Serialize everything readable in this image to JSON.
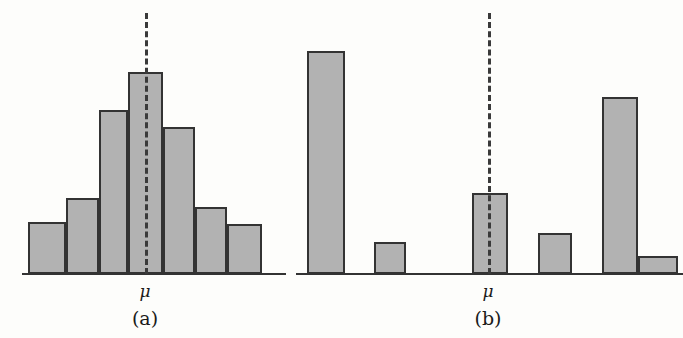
{
  "figure": {
    "background_color": "#fdfdfb",
    "bar_fill_color": "#b2b2b2",
    "bar_border_color": "#333333",
    "axis_color": "#333333",
    "mu_line_color": "#3a3a3a"
  },
  "chart_data": [
    {
      "type": "bar",
      "title": "(a)",
      "panel_label": "(a)",
      "xlabel": "",
      "ylabel": "",
      "annotations": [
        "μ"
      ],
      "mu_label": "μ",
      "mu_index": 3,
      "grid": false,
      "legend": "none",
      "axis_range_x": [
        0,
        7
      ],
      "ylim": [
        0,
        100
      ],
      "categories": [
        "1",
        "2",
        "3",
        "4",
        "5",
        "6",
        "7"
      ],
      "values": [
        25,
        37,
        81,
        100,
        72,
        33,
        25
      ],
      "description": "Symmetric bell-shaped histogram with mean line at the center (tallest bar)"
    },
    {
      "type": "bar",
      "title": "(b)",
      "panel_label": "(b)",
      "xlabel": "",
      "ylabel": "",
      "annotations": [
        "μ"
      ],
      "mu_label": "μ",
      "mu_index": 2,
      "grid": false,
      "legend": "none",
      "axis_range_x": [
        0,
        6
      ],
      "ylim": [
        0,
        100
      ],
      "categories": [
        "1",
        "2",
        "3",
        "4",
        "5",
        "6"
      ],
      "values": [
        100,
        14,
        36,
        19,
        79,
        8
      ],
      "description": "Irregular scattered histogram with mean line passing through a mid-height bar"
    }
  ],
  "panels": [
    {
      "id": "panel-a",
      "label": "(a)",
      "mu_label": "μ",
      "mu_label_x": 145,
      "mu_label_y": 283,
      "panel_label_x": 145,
      "panel_label_y": 309,
      "axis": {
        "x": 22,
        "y": 273,
        "width": 264
      },
      "mu_line": {
        "x": 145,
        "y_top": 13,
        "y_bottom": 274
      },
      "bars": [
        {
          "x": 28,
          "y": 222,
          "w": 38,
          "h": 52
        },
        {
          "x": 66,
          "y": 198,
          "w": 33,
          "h": 76
        },
        {
          "x": 99,
          "y": 110,
          "w": 29,
          "h": 164
        },
        {
          "x": 128,
          "y": 72,
          "w": 35,
          "h": 202
        },
        {
          "x": 163,
          "y": 127,
          "w": 32,
          "h": 147
        },
        {
          "x": 195,
          "y": 207,
          "w": 32,
          "h": 67
        },
        {
          "x": 227,
          "y": 224,
          "w": 35,
          "h": 50
        }
      ]
    },
    {
      "id": "panel-b",
      "label": "(b)",
      "mu_label": "μ",
      "mu_label_x": 488,
      "mu_label_y": 283,
      "panel_label_x": 488,
      "panel_label_y": 309,
      "axis": {
        "x": 296,
        "y": 273,
        "width": 387
      },
      "mu_line": {
        "x": 488,
        "y_top": 13,
        "y_bottom": 274
      },
      "bars": [
        {
          "x": 307,
          "y": 51,
          "w": 38,
          "h": 223
        },
        {
          "x": 374,
          "y": 242,
          "w": 32,
          "h": 32
        },
        {
          "x": 472,
          "y": 193,
          "w": 36,
          "h": 81
        },
        {
          "x": 538,
          "y": 233,
          "w": 34,
          "h": 41
        },
        {
          "x": 602,
          "y": 97,
          "w": 36,
          "h": 177
        },
        {
          "x": 638,
          "y": 256,
          "w": 40,
          "h": 18
        }
      ]
    }
  ]
}
